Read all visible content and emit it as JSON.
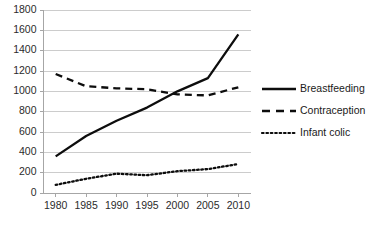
{
  "chart_data": {
    "type": "line",
    "title": "",
    "xlabel": "",
    "ylabel": "",
    "x": [
      1980,
      1985,
      1990,
      1995,
      2000,
      2005,
      2010
    ],
    "xlim": [
      1978,
      2012
    ],
    "ylim": [
      0,
      1800
    ],
    "ytick_labels": [
      "0",
      "200",
      "400",
      "600",
      "800",
      "1000",
      "1200",
      "1400",
      "1600",
      "1800"
    ],
    "ytick_values": [
      0,
      200,
      400,
      600,
      800,
      1000,
      1200,
      1400,
      1600,
      1800
    ],
    "xtick_labels": [
      "1980",
      "1985",
      "1990",
      "1995",
      "2000",
      "2005",
      "2010"
    ],
    "grid": "horizontal",
    "legend_position": "right",
    "series": [
      {
        "name": "Breastfeeding",
        "style": "solid",
        "color": "#0d0d0d",
        "x": [
          1980,
          1985,
          1990,
          1995,
          2000,
          2005,
          2010
        ],
        "values": [
          360,
          560,
          710,
          840,
          1000,
          1130,
          1560
        ]
      },
      {
        "name": "Contraception",
        "style": "dashed",
        "color": "#0d0d0d",
        "x": [
          1980,
          1985,
          1990,
          1995,
          2000,
          2005,
          2010
        ],
        "values": [
          1170,
          1050,
          1030,
          1020,
          970,
          960,
          1040
        ]
      },
      {
        "name": "Infant colic",
        "style": "dotted",
        "color": "#0d0d0d",
        "x": [
          1980,
          1985,
          1990,
          1995,
          2000,
          2005,
          2010
        ],
        "values": [
          80,
          140,
          190,
          175,
          215,
          235,
          285
        ]
      }
    ]
  },
  "legend": {
    "items": [
      {
        "label": "Breastfeeding",
        "style": "solid"
      },
      {
        "label": "Contraception",
        "style": "dashed"
      },
      {
        "label": "Infant colic",
        "style": "dotted"
      }
    ]
  },
  "colors": {
    "gridline": "#bfbfbf",
    "axis": "#a6a6a6",
    "series": "#0d0d0d",
    "text": "#2b2b2b",
    "background": "#ffffff"
  }
}
